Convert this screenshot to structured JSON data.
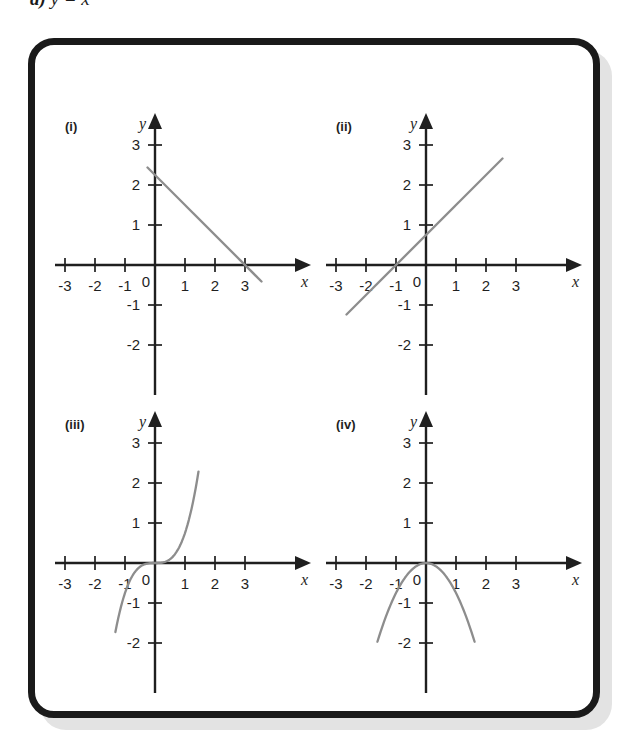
{
  "heading": {
    "part_label": "d)",
    "equation": "y = x"
  },
  "panel": {
    "frame_color": "#1a1a1a",
    "shadow_color": "#e3e3e3",
    "background": "#ffffff"
  },
  "style": {
    "axis_color": "#1f1f1f",
    "curve_color": "#8d8d8d",
    "text_color": "#1f1f1f"
  },
  "chart_data": [
    {
      "type": "line",
      "id": "i",
      "label": "(i)",
      "title": "",
      "xlabel": "x",
      "ylabel": "y",
      "xlim": [
        -3.6,
        3.9
      ],
      "ylim": [
        -2.7,
        3.6
      ],
      "xticks": [
        -3,
        -2,
        -1,
        1,
        2,
        3
      ],
      "xtick_labels": [
        "-3",
        "-2",
        "-1",
        "1",
        "2",
        "3"
      ],
      "yticks": [
        -2,
        -1,
        1,
        2,
        3
      ],
      "ytick_labels": [
        "-2",
        "-1",
        "1",
        "2",
        "3"
      ],
      "origin_label": "0",
      "grid": false,
      "legend": "none",
      "equation": "y = 3 - x",
      "slope": -1,
      "intercept": 3,
      "x": [
        -0.25,
        3.55
      ],
      "y": [
        3.25,
        -0.55
      ],
      "points": [
        [
          0,
          3
        ],
        [
          1,
          2
        ],
        [
          2,
          1
        ],
        [
          3,
          0
        ]
      ]
    },
    {
      "type": "line",
      "id": "ii",
      "label": "(ii)",
      "title": "",
      "xlabel": "x",
      "ylabel": "y",
      "xlim": [
        -3.6,
        3.9
      ],
      "ylim": [
        -2.7,
        3.6
      ],
      "xticks": [
        -3,
        -2,
        -1,
        1,
        2,
        3
      ],
      "xtick_labels": [
        "-3",
        "-2",
        "-1",
        "1",
        "2",
        "3"
      ],
      "yticks": [
        -2,
        -1,
        1,
        2,
        3
      ],
      "ytick_labels": [
        "-2",
        "-1",
        "1",
        "2",
        "3"
      ],
      "origin_label": "0",
      "grid": false,
      "legend": "none",
      "equation": "y = x + 1",
      "slope": 1,
      "intercept": 1,
      "x": [
        -2.65,
        2.55
      ],
      "y": [
        -1.65,
        3.55
      ],
      "points": [
        [
          -1,
          0
        ],
        [
          0,
          1
        ],
        [
          1,
          2
        ],
        [
          2,
          3
        ]
      ]
    },
    {
      "type": "line",
      "id": "iii",
      "label": "(iii)",
      "title": "",
      "xlabel": "x",
      "ylabel": "y",
      "xlim": [
        -3.6,
        3.9
      ],
      "ylim": [
        -2.7,
        3.6
      ],
      "xticks": [
        -3,
        -2,
        -1,
        1,
        2,
        3
      ],
      "xtick_labels": [
        "-3",
        "-2",
        "-1",
        "1",
        "2",
        "3"
      ],
      "yticks": [
        -2,
        -1,
        1,
        2,
        3
      ],
      "ytick_labels": [
        "-2",
        "-1",
        "1",
        "2",
        "3"
      ],
      "origin_label": "0",
      "grid": false,
      "legend": "none",
      "equation": "y = x^3",
      "x": [
        -1.32,
        -1.0,
        -0.5,
        0,
        0.5,
        1.0,
        1.45
      ],
      "y": [
        -2.3,
        -1.0,
        -0.125,
        0,
        0.125,
        1.0,
        3.05
      ],
      "points": [
        [
          -1,
          -1
        ],
        [
          0,
          0
        ],
        [
          1,
          1
        ],
        [
          1.44,
          3
        ]
      ]
    },
    {
      "type": "line",
      "id": "iv",
      "label": "(iv)",
      "title": "",
      "xlabel": "x",
      "ylabel": "y",
      "xlim": [
        -3.6,
        3.9
      ],
      "ylim": [
        -2.7,
        3.6
      ],
      "xticks": [
        -3,
        -2,
        -1,
        1,
        2,
        3
      ],
      "xtick_labels": [
        "-3",
        "-2",
        "-1",
        "1",
        "2",
        "3"
      ],
      "yticks": [
        -2,
        -1,
        1,
        2,
        3
      ],
      "ytick_labels": [
        "-2",
        "-1",
        "1",
        "2",
        "3"
      ],
      "origin_label": "0",
      "grid": false,
      "legend": "none",
      "equation": "y = -x^2",
      "x": [
        -1.62,
        -1.0,
        -0.5,
        0,
        0.5,
        1.0,
        1.62
      ],
      "y": [
        -2.62,
        -1.0,
        -0.25,
        0,
        -0.25,
        -1.0,
        -2.62
      ],
      "points": [
        [
          -1,
          -1
        ],
        [
          0,
          0
        ],
        [
          1,
          -1
        ]
      ]
    }
  ]
}
